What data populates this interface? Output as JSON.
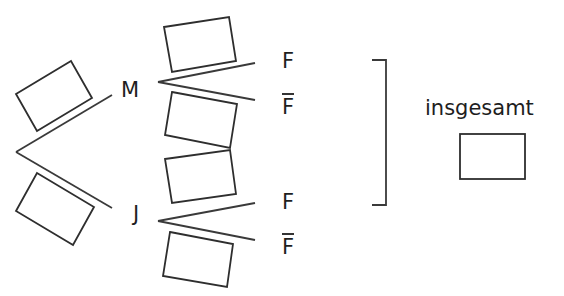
{
  "diagram": {
    "type": "probability-tree",
    "root": {
      "branches": [
        {
          "node_label": "M",
          "probability_box": "",
          "children": [
            {
              "label": "F",
              "overline": false,
              "probability_box": ""
            },
            {
              "label": "F",
              "overline": true,
              "probability_box": ""
            }
          ]
        },
        {
          "node_label": "J",
          "probability_box": "",
          "children": [
            {
              "label": "F",
              "overline": false,
              "probability_box": ""
            },
            {
              "label": "F",
              "overline": true,
              "probability_box": ""
            }
          ]
        }
      ]
    },
    "total": {
      "label": "insgesamt",
      "value_box": ""
    },
    "colors": {
      "line": "#3a3a3a",
      "text": "#1e1e1e",
      "background": "#ffffff"
    }
  }
}
